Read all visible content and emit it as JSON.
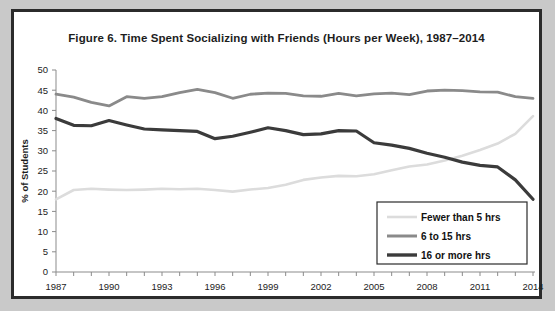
{
  "figure": {
    "title": "Figure 6. Time Spent Socializing with Friends (Hours per Week), 1987–2014",
    "border_color": "#2b2b2b",
    "page_background": "#c9c9c9",
    "panel_background": "#ffffff"
  },
  "chart_data": {
    "type": "line",
    "title": "Figure 6. Time Spent Socializing with Friends (Hours per Week), 1987–2014",
    "xlabel": "",
    "ylabel": "% of Students",
    "xlim": [
      1987,
      2014
    ],
    "ylim": [
      0,
      50
    ],
    "ytick_step": 5,
    "yticks": [
      0,
      5,
      10,
      15,
      20,
      25,
      30,
      35,
      40,
      45,
      50
    ],
    "xticks_major": [
      1987,
      1990,
      1993,
      1996,
      1999,
      2002,
      2005,
      2008,
      2011,
      2014
    ],
    "xticks_minor_every": 1,
    "grid": false,
    "legend_position": "bottom-right",
    "x": [
      1987,
      1988,
      1989,
      1990,
      1991,
      1992,
      1993,
      1994,
      1995,
      1996,
      1997,
      1998,
      1999,
      2000,
      2001,
      2002,
      2003,
      2004,
      2005,
      2006,
      2007,
      2008,
      2009,
      2010,
      2011,
      2012,
      2013,
      2014
    ],
    "series": [
      {
        "name": "Fewer than 5 hrs",
        "color": "#dcdcdc",
        "stroke_width": 2.6,
        "values": [
          18.0,
          20.3,
          20.6,
          20.4,
          20.3,
          20.4,
          20.6,
          20.5,
          20.6,
          20.3,
          19.9,
          20.4,
          20.8,
          21.6,
          22.8,
          23.4,
          23.8,
          23.7,
          24.2,
          25.2,
          26.1,
          26.6,
          27.6,
          28.8,
          30.2,
          31.8,
          34.2,
          38.6
        ]
      },
      {
        "name": "6 to 15 hrs",
        "color": "#8a8a8a",
        "stroke_width": 2.8,
        "values": [
          44.0,
          43.3,
          42.0,
          41.1,
          43.4,
          43.0,
          43.4,
          44.4,
          45.2,
          44.4,
          43.0,
          44.0,
          44.3,
          44.2,
          43.6,
          43.5,
          44.2,
          43.6,
          44.1,
          44.3,
          43.9,
          44.8,
          45.0,
          44.9,
          44.6,
          44.5,
          43.4,
          43.0
        ]
      },
      {
        "name": "16 or more hrs",
        "color": "#3b3b3b",
        "stroke_width": 3.2,
        "values": [
          38.0,
          36.3,
          36.2,
          37.5,
          36.4,
          35.4,
          35.2,
          35.0,
          34.8,
          33.0,
          33.6,
          34.6,
          35.7,
          35.0,
          34.0,
          34.2,
          35.0,
          34.9,
          32.0,
          31.4,
          30.6,
          29.4,
          28.4,
          27.2,
          26.4,
          26.0,
          22.8,
          18.0
        ]
      }
    ]
  },
  "legend": {
    "items": [
      {
        "label": "Fewer than 5 hrs",
        "color": "#dcdcdc"
      },
      {
        "label": "6 to 15 hrs",
        "color": "#8a8a8a"
      },
      {
        "label": "16 or more hrs",
        "color": "#3b3b3b"
      }
    ]
  }
}
